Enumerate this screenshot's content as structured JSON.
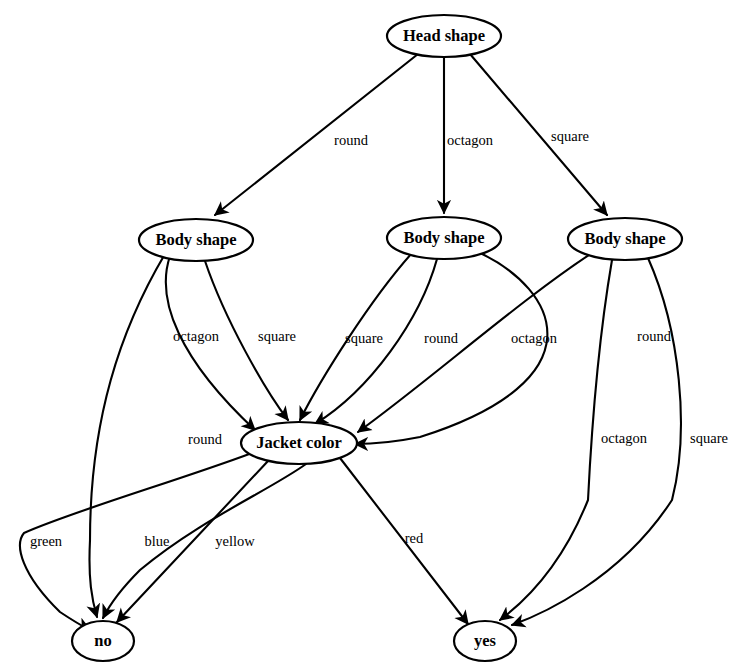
{
  "diagram": {
    "type": "decision-tree",
    "title": "",
    "width": 744,
    "height": 671,
    "colors": {
      "stroke": "#000000",
      "node_fill": "#ffffff",
      "background": "#ffffff",
      "text": "#000000"
    },
    "nodes": [
      {
        "id": "head",
        "label": "Head shape",
        "kind": "root-decision",
        "cx": 444,
        "cy": 36,
        "rx": 57,
        "ry": 21
      },
      {
        "id": "body_left",
        "label": "Body shape",
        "kind": "decision",
        "cx": 196,
        "cy": 240,
        "rx": 57,
        "ry": 21
      },
      {
        "id": "body_mid",
        "label": "Body shape",
        "kind": "decision",
        "cx": 444,
        "cy": 238,
        "rx": 57,
        "ry": 21
      },
      {
        "id": "body_right",
        "label": "Body shape",
        "kind": "decision",
        "cx": 625,
        "cy": 239,
        "rx": 57,
        "ry": 21
      },
      {
        "id": "jacket",
        "label": "Jacket color",
        "kind": "decision",
        "cx": 299,
        "cy": 443,
        "rx": 58,
        "ry": 21
      },
      {
        "id": "no",
        "label": "no",
        "kind": "leaf",
        "cx": 103,
        "cy": 641,
        "rx": 31,
        "ry": 20
      },
      {
        "id": "yes",
        "label": "yes",
        "kind": "leaf",
        "cx": 485,
        "cy": 641,
        "rx": 31,
        "ry": 20
      }
    ],
    "edges": [
      {
        "from": "head",
        "to": "body_left",
        "label": "round",
        "label_x": 351,
        "label_y": 142
      },
      {
        "from": "head",
        "to": "body_mid",
        "label": "octagon",
        "label_x": 470,
        "label_y": 142
      },
      {
        "from": "head",
        "to": "body_right",
        "label": "square",
        "label_x": 570,
        "label_y": 138
      },
      {
        "from": "body_left",
        "to": "no",
        "label": "round",
        "label_x": 205,
        "label_y": 441
      },
      {
        "from": "body_left",
        "to": "jacket",
        "label": "octagon",
        "label_x": 196,
        "label_y": 338
      },
      {
        "from": "body_left",
        "to": "jacket",
        "label": "square",
        "label_x": 277,
        "label_y": 338
      },
      {
        "from": "body_mid",
        "to": "jacket",
        "label": "square",
        "label_x": 364,
        "label_y": 340
      },
      {
        "from": "body_mid",
        "to": "jacket",
        "label": "round",
        "label_x": 441,
        "label_y": 340
      },
      {
        "from": "body_mid",
        "to": "jacket",
        "label": "octagon",
        "label_x": 534,
        "label_y": 340
      },
      {
        "from": "body_right",
        "to": "jacket",
        "label": "round",
        "label_x": 654,
        "label_y": 338
      },
      {
        "from": "body_right",
        "to": "yes",
        "label": "octagon",
        "label_x": 624,
        "label_y": 440
      },
      {
        "from": "body_right",
        "to": "yes",
        "label": "square",
        "label_x": 709,
        "label_y": 440
      },
      {
        "from": "jacket",
        "to": "no",
        "label": "green",
        "label_x": 46,
        "label_y": 543
      },
      {
        "from": "jacket",
        "to": "no",
        "label": "blue",
        "label_x": 157,
        "label_y": 543
      },
      {
        "from": "jacket",
        "to": "no",
        "label": "yellow",
        "label_x": 235,
        "label_y": 543
      },
      {
        "from": "jacket",
        "to": "yes",
        "label": "red",
        "label_x": 414,
        "label_y": 540
      }
    ]
  }
}
